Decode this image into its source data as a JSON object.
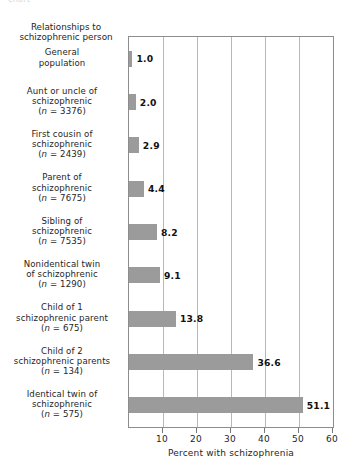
{
  "figure": {
    "top_clipped_caption": "chart",
    "header_label": "Relationships to\nschizophrenic person"
  },
  "chart_data": {
    "type": "bar",
    "orientation": "horizontal",
    "title": "",
    "subtitle": "",
    "xlabel": "Percent with schizophrenia",
    "ylabel": "Relationships to schizophrenic person",
    "xlim": [
      0,
      60
    ],
    "xticks": [
      10,
      20,
      30,
      40,
      50,
      60
    ],
    "xtick_labels": [
      "10",
      "20",
      "30",
      "40",
      "50",
      "60"
    ],
    "grid": true,
    "grid_axis": "x",
    "legend": false,
    "bar_color": "#9b9b9b",
    "categories": [
      "General population",
      "Aunt or uncle of schizophrenic (n = 3376)",
      "First cousin of schizophrenic (n = 2439)",
      "Parent of schizophrenic (n = 7675)",
      "Sibling of schizophrenic (n = 7535)",
      "Nonidentical twin of schizophrenic (n = 1290)",
      "Child of 1 schizophrenic parent (n = 675)",
      "Child of 2 schizophrenic parents (n = 134)",
      "Identical twin of schizophrenic (n = 575)"
    ],
    "values": [
      1.0,
      2.0,
      2.9,
      4.4,
      8.2,
      9.1,
      13.8,
      36.6,
      51.1
    ],
    "data_labels": [
      "1.0",
      "2.0",
      "2.9",
      "4.4",
      "8.2",
      "9.1",
      "13.8",
      "36.6",
      "51.1"
    ]
  },
  "categories_display": [
    {
      "lines": [
        "General",
        "population"
      ],
      "n": "",
      "value_label": "1.0"
    },
    {
      "lines": [
        "Aunt or uncle of",
        "schizophrenic"
      ],
      "n": "3376",
      "value_label": "2.0"
    },
    {
      "lines": [
        "First cousin of",
        "schizophrenic"
      ],
      "n": "2439",
      "value_label": "2.9"
    },
    {
      "lines": [
        "Parent of",
        "schizophrenic"
      ],
      "n": "7675",
      "value_label": "4.4"
    },
    {
      "lines": [
        "Sibling of",
        "schizophrenic"
      ],
      "n": "7535",
      "value_label": "8.2"
    },
    {
      "lines": [
        "Nonidentical twin",
        "of schizophrenic"
      ],
      "n": "1290",
      "value_label": "9.1"
    },
    {
      "lines": [
        "Child of 1",
        "schizophrenic parent"
      ],
      "n": "675",
      "value_label": "13.8"
    },
    {
      "lines": [
        "Child of 2",
        "schizophrenic parents"
      ],
      "n": "134",
      "value_label": "36.6"
    },
    {
      "lines": [
        "Identical twin of",
        "schizophrenic"
      ],
      "n": "575",
      "value_label": "51.1"
    }
  ],
  "axis": {
    "n_prefix": "(",
    "n_symbol": "n",
    "n_equals": " = ",
    "n_suffix": ")"
  }
}
